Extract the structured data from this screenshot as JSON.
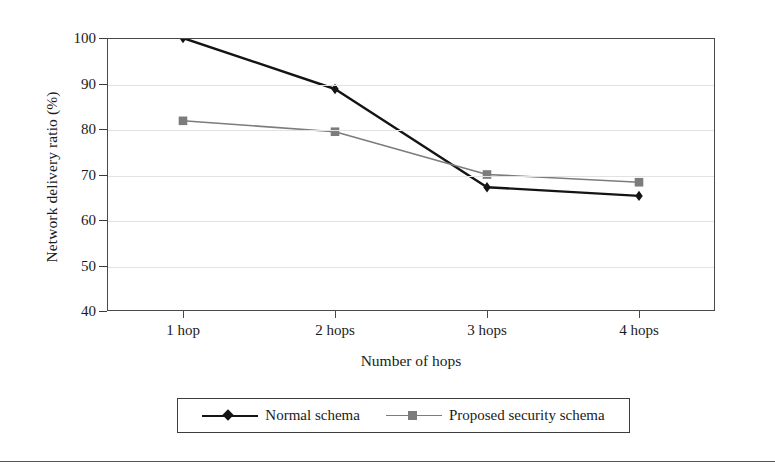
{
  "figure": {
    "background_color": "#ffffff",
    "has_bottom_rule": true
  },
  "chart_data": {
    "type": "line",
    "title": "",
    "xlabel": "Number of hops",
    "ylabel": "Network delivery ratio (%)",
    "categories": [
      "1 hop",
      "2 hops",
      "3 hops",
      "4 hops"
    ],
    "ylim": [
      40,
      100
    ],
    "yticks": [
      40,
      50,
      60,
      70,
      80,
      90,
      100
    ],
    "ytick_labels": [
      "40",
      "50",
      "60",
      "70",
      "80",
      "90",
      "100"
    ],
    "grid": true,
    "grid_axis": "y",
    "legend_position": "below-axes",
    "series": [
      {
        "name": "Normal schema",
        "values": [
          100.0,
          88.8,
          67.2,
          65.3
        ],
        "color": "#141414",
        "marker": "diamond",
        "line_width": 2.4
      },
      {
        "name": "Proposed security schema",
        "values": [
          81.8,
          79.4,
          70.0,
          68.3
        ],
        "color": "#7c7c7c",
        "marker": "square",
        "line_width": 1.6
      }
    ]
  },
  "axes": {
    "y_title": "Network delivery ratio (%)",
    "x_title": "Number of hops",
    "frame_color": "#4a4a4a",
    "gridline_color": "#e2e2e6"
  },
  "legend": {
    "entries": [
      {
        "label": "Normal schema",
        "color": "#141414",
        "marker": "diamond"
      },
      {
        "label": "Proposed security schema",
        "color": "#7c7c7c",
        "marker": "square"
      }
    ]
  }
}
